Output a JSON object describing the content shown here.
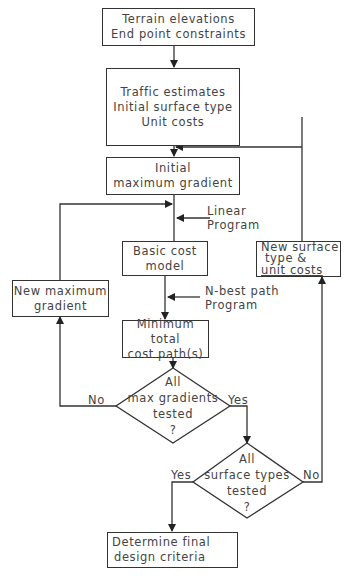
{
  "diagram": {
    "type": "flowchart",
    "nodes": {
      "terrain": {
        "lines": [
          "Terrain elevations",
          "End point constraints"
        ]
      },
      "traffic": {
        "lines": [
          "Traffic estimates",
          "Initial surface type",
          "Unit costs"
        ]
      },
      "initial_gradient": {
        "lines": [
          "Initial",
          "maximum gradient"
        ]
      },
      "basic_cost": {
        "lines": [
          "Basic cost",
          "model"
        ]
      },
      "new_surface": {
        "lines": [
          "New surface",
          "type &",
          "unit costs"
        ]
      },
      "new_gradient": {
        "lines": [
          "New maximum",
          "gradient"
        ]
      },
      "min_cost": {
        "lines": [
          "Minimum total",
          "cost path(s)"
        ]
      },
      "decision_gradients": {
        "lines": [
          "All",
          "max gradients",
          "tested",
          "?"
        ]
      },
      "decision_surfaces": {
        "lines": [
          "All",
          "surface types",
          "tested",
          "?"
        ]
      },
      "final": {
        "lines": [
          "Determine final",
          "design criteria"
        ]
      }
    },
    "inputs": {
      "linear_program": {
        "lines": [
          "Linear",
          "Program"
        ]
      },
      "nbest_program": {
        "lines": [
          "N-best  path",
          "Program"
        ]
      }
    },
    "edge_labels": {
      "gradients_no": "No",
      "gradients_yes": "Yes",
      "surfaces_yes": "Yes",
      "surfaces_no": "No"
    },
    "colors": {
      "line": "#333333",
      "text": "#444444",
      "background": "#ffffff"
    }
  }
}
